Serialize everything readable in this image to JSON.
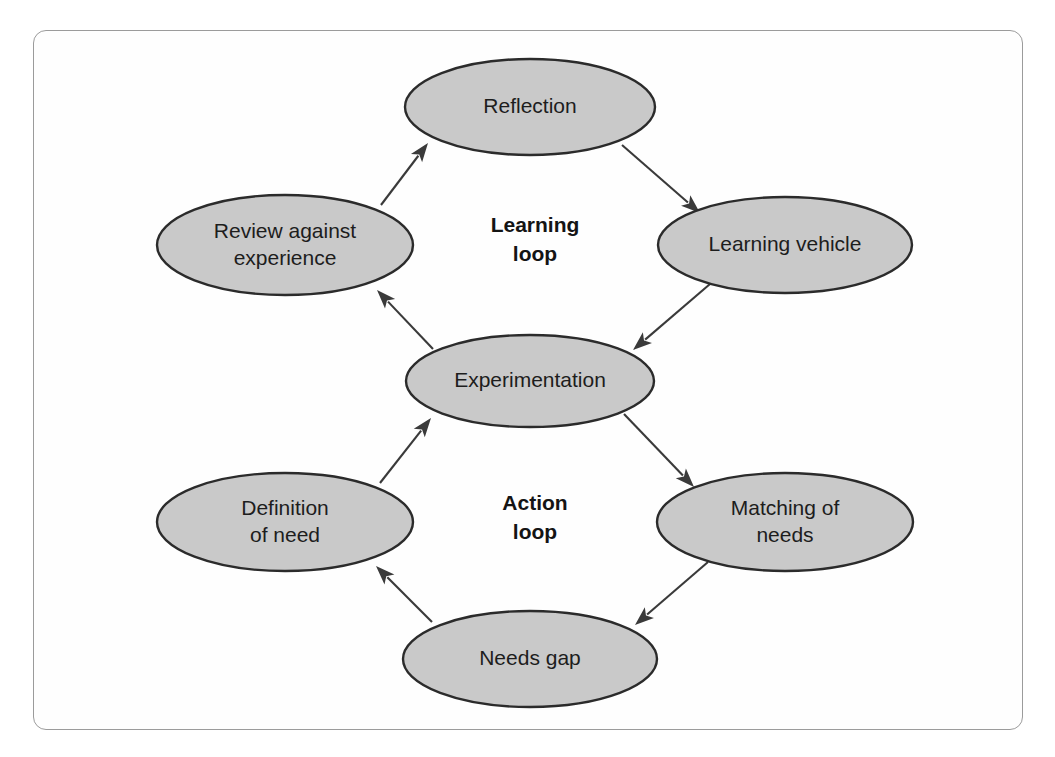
{
  "figure": {
    "type": "cycle-diagram",
    "background_color": "#ffffff",
    "frame_border_color": "#9b9b9b",
    "node_fill_color": "#c9c9c9",
    "node_stroke_color": "#2b2b2b",
    "edge_color": "#3a3a3a",
    "text_color": "#1d1d1d"
  },
  "nodes": [
    {
      "id": "reflection",
      "label": "Reflection",
      "label_lines": [
        "Reflection"
      ],
      "cx": 530,
      "cy": 107,
      "rx": 125,
      "ry": 48
    },
    {
      "id": "learning_vehicle",
      "label": "Learning vehicle",
      "label_lines": [
        "Learning vehicle"
      ],
      "cx": 785,
      "cy": 245,
      "rx": 127,
      "ry": 48
    },
    {
      "id": "experimentation",
      "label": "Experimentation",
      "label_lines": [
        "Experimentation"
      ],
      "cx": 530,
      "cy": 381,
      "rx": 124,
      "ry": 46
    },
    {
      "id": "matching_of_needs",
      "label": "Matching of needs",
      "label_lines": [
        "Matching of",
        "needs"
      ],
      "cx": 785,
      "cy": 522,
      "rx": 128,
      "ry": 49
    },
    {
      "id": "needs_gap",
      "label": "Needs gap",
      "label_lines": [
        "Needs gap"
      ],
      "cx": 530,
      "cy": 659,
      "rx": 127,
      "ry": 48
    },
    {
      "id": "definition_of_need",
      "label": "Definition of need",
      "label_lines": [
        "Definition",
        "of need"
      ],
      "cx": 285,
      "cy": 522,
      "rx": 128,
      "ry": 49
    },
    {
      "id": "review_against_experience",
      "label": "Review against experience",
      "label_lines": [
        "Review against",
        "experience"
      ],
      "cx": 285,
      "cy": 245,
      "rx": 128,
      "ry": 50
    }
  ],
  "loop_labels": [
    {
      "id": "learning_loop",
      "lines": [
        "Learning",
        "loop"
      ],
      "cx": 535,
      "cy": 240
    },
    {
      "id": "action_loop",
      "lines": [
        "Action",
        "loop"
      ],
      "cx": 535,
      "cy": 518
    }
  ],
  "edges": [
    {
      "id": "review-to-reflection",
      "from": "review_against_experience",
      "to": "reflection",
      "x1": 381,
      "y1": 205,
      "x2": 428,
      "y2": 143
    },
    {
      "id": "reflection-to-vehicle",
      "from": "reflection",
      "to": "learning_vehicle",
      "x1": 622,
      "y1": 145,
      "x2": 700,
      "y2": 213
    },
    {
      "id": "vehicle-to-experimentation",
      "from": "learning_vehicle",
      "to": "experimentation",
      "x1": 710,
      "y1": 284,
      "x2": 633,
      "y2": 350
    },
    {
      "id": "experimentation-to-review",
      "from": "experimentation",
      "to": "review_against_experience",
      "x1": 433,
      "y1": 349,
      "x2": 377,
      "y2": 290
    },
    {
      "id": "experimentation-to-matching",
      "from": "experimentation",
      "to": "matching_of_needs",
      "x1": 624,
      "y1": 414,
      "x2": 694,
      "y2": 487
    },
    {
      "id": "matching-to-needsgap",
      "from": "matching_of_needs",
      "to": "needs_gap",
      "x1": 708,
      "y1": 562,
      "x2": 635,
      "y2": 625
    },
    {
      "id": "needsgap-to-definition",
      "from": "needs_gap",
      "to": "definition_of_need",
      "x1": 432,
      "y1": 622,
      "x2": 376,
      "y2": 566
    },
    {
      "id": "definition-to-experimentation",
      "from": "definition_of_need",
      "to": "experimentation",
      "x1": 380,
      "y1": 483,
      "x2": 431,
      "y2": 418
    }
  ]
}
